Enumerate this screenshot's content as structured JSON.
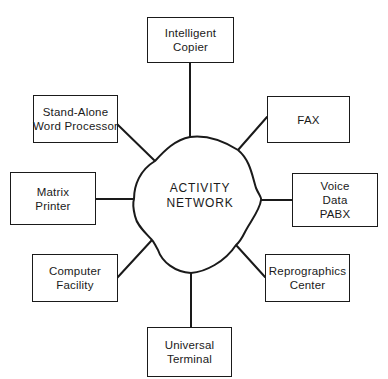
{
  "diagram": {
    "type": "hub-and-spoke",
    "colors": {
      "stroke": "#1a1a1a",
      "background": "#ffffff"
    },
    "hub": {
      "shape": "cloud",
      "label_lines": [
        "ACTIVITY",
        "NETWORK"
      ]
    },
    "nodes": [
      {
        "id": "intelligent-copier",
        "position": "top",
        "label_lines": [
          "Intelligent",
          "Copier"
        ]
      },
      {
        "id": "stand-alone-word-processor",
        "position": "upper-left",
        "label_lines": [
          "Stand-Alone",
          "Word Processor"
        ]
      },
      {
        "id": "fax",
        "position": "upper-right",
        "label_lines": [
          "FAX"
        ]
      },
      {
        "id": "matrix-printer",
        "position": "left",
        "label_lines": [
          "Matrix",
          "Printer"
        ]
      },
      {
        "id": "voice-data-pabx",
        "position": "right",
        "label_lines": [
          "Voice",
          "Data",
          "PABX"
        ]
      },
      {
        "id": "computer-facility",
        "position": "lower-left",
        "label_lines": [
          "Computer",
          "Facility"
        ]
      },
      {
        "id": "reprographics-center",
        "position": "lower-right",
        "label_lines": [
          "Reprographics",
          "Center"
        ]
      },
      {
        "id": "universal-terminal",
        "position": "bottom",
        "label_lines": [
          "Universal",
          "Terminal"
        ]
      }
    ],
    "edges": [
      {
        "from": "activity-network",
        "to": "intelligent-copier"
      },
      {
        "from": "activity-network",
        "to": "stand-alone-word-processor"
      },
      {
        "from": "activity-network",
        "to": "fax"
      },
      {
        "from": "activity-network",
        "to": "matrix-printer"
      },
      {
        "from": "activity-network",
        "to": "voice-data-pabx"
      },
      {
        "from": "activity-network",
        "to": "computer-facility"
      },
      {
        "from": "activity-network",
        "to": "reprographics-center"
      },
      {
        "from": "activity-network",
        "to": "universal-terminal"
      }
    ]
  }
}
